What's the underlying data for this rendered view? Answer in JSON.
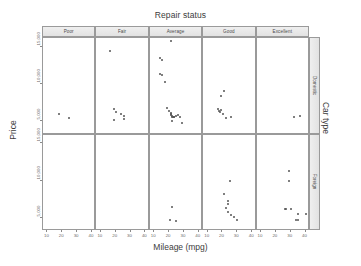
{
  "chart_data": {
    "type": "scatter",
    "title": "Repair status",
    "xlabel": "Mileage (mpg)",
    "ylabel": "Price",
    "right_label": "Car type",
    "grid": false,
    "legend": "none",
    "xlim": [
      7,
      43
    ],
    "ylim": [
      3200,
      16200
    ],
    "xticks": [
      10,
      20,
      30,
      40
    ],
    "xtick_labels": [
      "10",
      "20",
      "30",
      "40"
    ],
    "yticks": [
      5000,
      10000,
      15000
    ],
    "ytick_labels": [
      "5,000",
      "10,000",
      "15,000"
    ],
    "col_facets": [
      "Poor",
      "Fair",
      "Average",
      "Good",
      "Excellent"
    ],
    "row_facets": [
      "Domestic",
      "Foreign"
    ],
    "panels": [
      {
        "row": "Domestic",
        "col": "Poor",
        "points": [
          [
            18.0,
            6000.0
          ],
          [
            24.5,
            5400.0
          ]
        ]
      },
      {
        "row": "Domestic",
        "col": "Fair",
        "points": [
          [
            16.0,
            14500.0
          ],
          [
            19.0,
            6600.0
          ],
          [
            20.5,
            6200.0
          ],
          [
            19.0,
            5200.0
          ],
          [
            23.5,
            5900.0
          ],
          [
            25.5,
            5700.0
          ],
          [
            25.5,
            5300.0
          ]
        ]
      },
      {
        "row": "Domestic",
        "col": "Average",
        "points": [
          [
            21.0,
            15800.0
          ],
          [
            14.0,
            13500.0
          ],
          [
            15.5,
            13300.0
          ],
          [
            14.0,
            11300.0
          ],
          [
            15.5,
            11200.0
          ],
          [
            17.5,
            10300.0
          ],
          [
            18.5,
            6800.0
          ],
          [
            20.0,
            6300.0
          ],
          [
            21.0,
            6100.0
          ],
          [
            21.0,
            5900.0
          ],
          [
            21.5,
            5800.0
          ],
          [
            22.0,
            5750.0
          ],
          [
            22.0,
            5600.0
          ],
          [
            22.5,
            5550.0
          ],
          [
            23.0,
            5500.0
          ],
          [
            23.5,
            5600.0
          ],
          [
            24.5,
            5700.0
          ],
          [
            26.0,
            5800.0
          ],
          [
            27.5,
            5600.0
          ],
          [
            22.0,
            5000.0
          ],
          [
            28.5,
            4800.0
          ]
        ]
      },
      {
        "row": "Domestic",
        "col": "Good",
        "points": [
          [
            21.0,
            9000.0
          ],
          [
            19.0,
            8400.0
          ],
          [
            17.0,
            6700.0
          ],
          [
            17.5,
            6400.0
          ],
          [
            19.0,
            6500.0
          ],
          [
            18.5,
            6200.0
          ],
          [
            20.5,
            6000.0
          ],
          [
            22.5,
            5400.0
          ],
          [
            25.5,
            5600.0
          ]
        ]
      },
      {
        "row": "Domestic",
        "col": "Excellent",
        "points": [
          [
            32.0,
            5500.0
          ],
          [
            36.0,
            5700.0
          ]
        ]
      },
      {
        "row": "Foreign",
        "col": "Poor",
        "points": []
      },
      {
        "row": "Foreign",
        "col": "Fair",
        "points": []
      },
      {
        "row": "Foreign",
        "col": "Average",
        "points": [
          [
            22.0,
            6400.0
          ],
          [
            20.5,
            4700.0
          ],
          [
            25.0,
            4500.0
          ]
        ]
      },
      {
        "row": "Foreign",
        "col": "Good",
        "points": [
          [
            25.0,
            9900.0
          ],
          [
            21.0,
            8200.0
          ],
          [
            23.5,
            7300.0
          ],
          [
            23.5,
            6800.0
          ],
          [
            22.5,
            6300.0
          ],
          [
            24.0,
            5700.0
          ],
          [
            25.5,
            5400.0
          ],
          [
            27.5,
            5100.0
          ],
          [
            29.5,
            4700.0
          ]
        ]
      },
      {
        "row": "Foreign",
        "col": "Excellent",
        "points": [
          [
            29.0,
            11300.0
          ],
          [
            29.0,
            9900.0
          ],
          [
            26.0,
            6200.0
          ],
          [
            26.5,
            6200.0
          ],
          [
            30.0,
            6200.0
          ],
          [
            35.0,
            5500.0
          ],
          [
            33.5,
            4700.0
          ],
          [
            35.0,
            4700.0
          ],
          [
            40.0,
            5500.0
          ]
        ]
      }
    ]
  }
}
